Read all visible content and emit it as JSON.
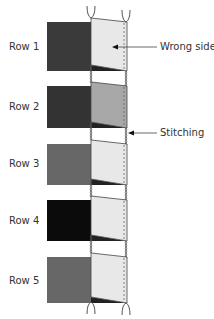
{
  "diagram": {
    "type": "knitting-seam-diagram",
    "rows": [
      {
        "label": "Row 1",
        "block_color": "#3a3a3a",
        "panel_color": "#e8e8e8",
        "block_y": 22,
        "block_h": 49,
        "label_y": 41
      },
      {
        "label": "Row 2",
        "block_color": "#333333",
        "panel_color": "#a8a8a8",
        "block_y": 86,
        "block_h": 42,
        "label_y": 101
      },
      {
        "label": "Row 3",
        "block_color": "#676767",
        "panel_color": "#e8e8e8",
        "block_y": 144,
        "block_h": 41,
        "label_y": 158
      },
      {
        "label": "Row 4",
        "block_color": "#0b0b0b",
        "panel_color": "#e8e8e8",
        "block_y": 200,
        "block_h": 41,
        "label_y": 215
      },
      {
        "label": "Row 5",
        "block_color": "#676767",
        "panel_color": "#e8e8e8",
        "block_y": 257,
        "block_h": 46,
        "label_y": 275
      }
    ],
    "callouts": {
      "wrong_side": {
        "label": "Wrong side",
        "x": 160,
        "y": 41
      },
      "stitching": {
        "label": "Stitching",
        "x": 160,
        "y": 127
      }
    },
    "colors": {
      "stitch": "#555555",
      "text": "#333333",
      "shadow": "#222222"
    }
  }
}
